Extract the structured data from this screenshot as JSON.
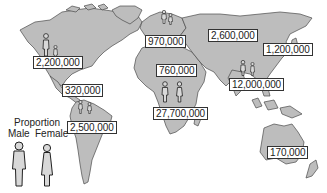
{
  "map": {
    "land_color": "#bdbdbd",
    "outline_color": "#4a4a4a",
    "background": "#ffffff"
  },
  "legend": {
    "title": "Proportion",
    "male_label": "Male",
    "female_label": "Female"
  },
  "regions": [
    {
      "id": "north-america",
      "value": "2,200,000"
    },
    {
      "id": "central-america-caribbean",
      "value": "320,000"
    },
    {
      "id": "south-america",
      "value": "2,500,000"
    },
    {
      "id": "western-europe",
      "value": "970,000"
    },
    {
      "id": "north-africa-middle-east",
      "value": "760,000"
    },
    {
      "id": "sub-saharan-africa",
      "value": "27,700,000"
    },
    {
      "id": "eastern-europe-central-asia",
      "value": "2,600,000"
    },
    {
      "id": "east-asia",
      "value": "1,200,000"
    },
    {
      "id": "south-southeast-asia",
      "value": "12,000,000"
    },
    {
      "id": "oceania",
      "value": "170,000"
    }
  ]
}
